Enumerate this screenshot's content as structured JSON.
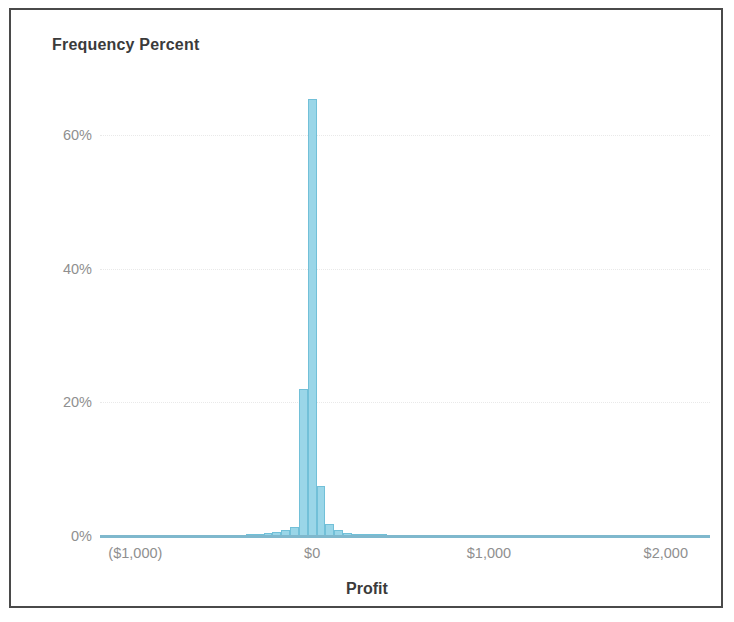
{
  "chart_data": {
    "type": "bar",
    "title": "Frequency Percent",
    "xlabel": "Profit",
    "ylabel": "Frequency Percent",
    "ylim": [
      0,
      70
    ],
    "xlim": [
      -1200,
      2250
    ],
    "grid": true,
    "legend": "none",
    "y_ticks": [
      {
        "value": 0,
        "label": "0%"
      },
      {
        "value": 20,
        "label": "20%"
      },
      {
        "value": 40,
        "label": "40%"
      },
      {
        "value": 60,
        "label": "60%"
      }
    ],
    "x_ticks": [
      {
        "value": -1000,
        "label": "($1,000)"
      },
      {
        "value": 0,
        "label": "$0"
      },
      {
        "value": 1000,
        "label": "$1,000"
      },
      {
        "value": 2000,
        "label": "$2,000"
      }
    ],
    "bin_width": 50,
    "categories": [
      "-350",
      "-300",
      "-250",
      "-200",
      "-150",
      "-100",
      "-50",
      "0",
      "50",
      "100",
      "150",
      "200",
      "250",
      "300",
      "350",
      "400"
    ],
    "values": [
      0.2,
      0.3,
      0.4,
      0.6,
      0.9,
      1.4,
      22.0,
      65.3,
      7.5,
      1.8,
      0.9,
      0.5,
      0.3,
      0.2,
      0.15,
      0.1
    ],
    "series": [
      {
        "name": "Frequency Percent",
        "values": [
          0.2,
          0.3,
          0.4,
          0.6,
          0.9,
          1.4,
          22.0,
          65.3,
          7.5,
          1.8,
          0.9,
          0.5,
          0.3,
          0.2,
          0.15,
          0.1
        ]
      }
    ],
    "bar_color": "#9ad6e8",
    "bar_border_color": "#72c0d8",
    "axis_color": "#7fb8cd",
    "tick_label_color": "#8f8f8f",
    "title_color": "#3b3b3b",
    "frame_color": "#4a4a4a",
    "background_color": "#ffffff"
  }
}
